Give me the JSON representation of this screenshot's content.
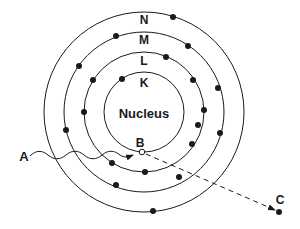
{
  "diagram": {
    "type": "bohr-atom-model",
    "center": {
      "x": 144,
      "y": 112
    },
    "nucleus_label": "Nucleus",
    "shells": [
      {
        "name": "K",
        "radius": 40,
        "electrons": [
          [
            122,
            79
          ]
        ]
      },
      {
        "name": "L",
        "radius": 60,
        "electrons": [
          [
            166,
            57
          ],
          [
            193,
            80
          ],
          [
            204,
            110
          ],
          [
            192,
            144
          ],
          [
            145,
            172
          ],
          [
            112,
            163
          ],
          [
            84,
            112
          ],
          [
            93,
            80
          ]
        ]
      },
      {
        "name": "M",
        "radius": 80,
        "electrons": [
          [
            116,
            36
          ],
          [
            188,
            46
          ],
          [
            198,
            125
          ],
          [
            116,
            185
          ],
          [
            79,
            66
          ]
        ]
      },
      {
        "name": "N",
        "radius": 100,
        "electrons": [
          [
            173,
            17
          ],
          [
            218,
            88
          ],
          [
            220,
            133
          ],
          [
            179,
            177
          ],
          [
            153,
            211
          ],
          [
            79,
            130
          ]
        ]
      }
    ],
    "points": {
      "A": {
        "label": "A",
        "x": 22,
        "y": 156
      },
      "B": {
        "label": "B",
        "x": 142,
        "y": 152
      },
      "C": {
        "label": "C",
        "x": 279,
        "y": 212
      }
    },
    "line_color": "#1a1a1a"
  },
  "labels": {
    "nucleus": "Nucleus",
    "K": "K",
    "L": "L",
    "M": "M",
    "N": "N",
    "A": "A",
    "B": "B",
    "C": "C"
  }
}
